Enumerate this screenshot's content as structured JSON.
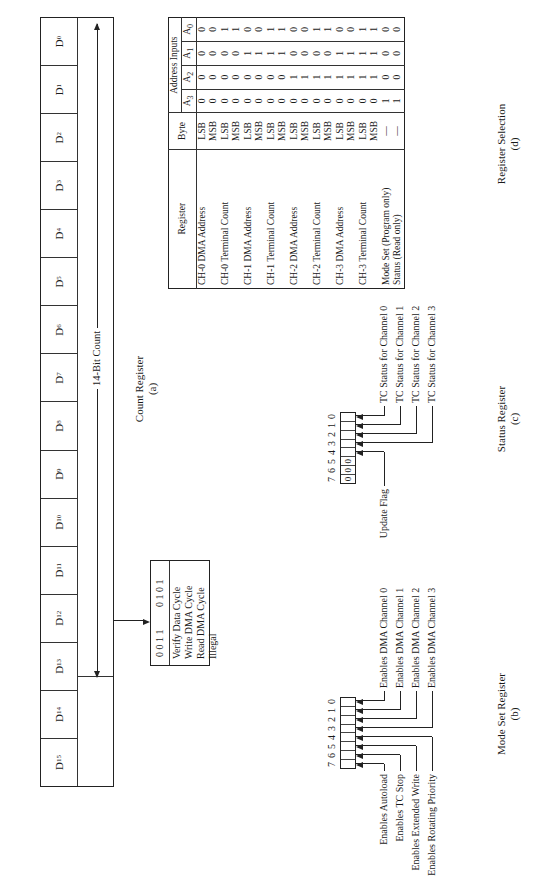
{
  "figure": {
    "count_register": {
      "bits": [
        "D15",
        "D14",
        "D13",
        "D12",
        "D11",
        "D10",
        "D9",
        "D8",
        "D7",
        "D6",
        "D5",
        "D4",
        "D3",
        "D2",
        "D1",
        "D0"
      ],
      "span_label": "14-Bit Count",
      "caption": "Count Register",
      "caption_letter": "(a)"
    },
    "cycle_types": {
      "rows": [
        {
          "label": "Verify Data Cycle",
          "b1": "0",
          "b0": "0"
        },
        {
          "label": "Write DMA Cycle",
          "b1": "0",
          "b0": "1"
        },
        {
          "label": "Read DMA Cycle",
          "b1": "1",
          "b0": "0"
        },
        {
          "label": "Illegal",
          "b1": "1",
          "b0": "1"
        }
      ]
    },
    "mode_set_register": {
      "bit_numbers": [
        "7",
        "6",
        "5",
        "4",
        "3",
        "2",
        "1",
        "0"
      ],
      "left_labels": [
        "Enables Autoload",
        "Enables TC Stop",
        "Enables Extended Write",
        "Enables Rotating Priority"
      ],
      "right_labels": [
        "Enables DMA Channel 0",
        "Enables DMA Channel 1",
        "Enables DMA Channel 2",
        "Enables DMA Channel 3"
      ],
      "caption": "Mode Set Register",
      "caption_letter": "(b)"
    },
    "status_register": {
      "bit_numbers": [
        "7",
        "6",
        "5",
        "4",
        "3",
        "2",
        "1",
        "0"
      ],
      "fixed_bits": [
        "0",
        "0",
        "0",
        "",
        "",
        "",
        "",
        ""
      ],
      "left_label": "Update Flag",
      "right_labels": [
        "TC Status for Channel 0",
        "TC Status for Channel 1",
        "TC Status for Channel 2",
        "TC Status for Channel 3"
      ],
      "caption": "Status Register",
      "caption_letter": "(c)"
    },
    "register_selection": {
      "headers": {
        "register": "Register",
        "byte": "Byte",
        "address_inputs": "Address Inputs",
        "a3": "A3",
        "a2": "A2",
        "a1": "A1",
        "a0": "A0"
      },
      "rows": [
        {
          "register": "CH-0 DMA Address",
          "byte": "LSB",
          "a3": "0",
          "a2": "0",
          "a1": "0",
          "a0": "0"
        },
        {
          "register": "",
          "byte": "MSB",
          "a3": "0",
          "a2": "0",
          "a1": "0",
          "a0": "0"
        },
        {
          "register": "CH-0 Terminal Count",
          "byte": "LSB",
          "a3": "0",
          "a2": "0",
          "a1": "0",
          "a0": "1"
        },
        {
          "register": "",
          "byte": "MSB",
          "a3": "0",
          "a2": "0",
          "a1": "0",
          "a0": "1"
        },
        {
          "register": "CH-1 DMA Address",
          "byte": "LSB",
          "a3": "0",
          "a2": "0",
          "a1": "1",
          "a0": "0"
        },
        {
          "register": "",
          "byte": "MSB",
          "a3": "0",
          "a2": "0",
          "a1": "1",
          "a0": "0"
        },
        {
          "register": "CH-1 Terminal Count",
          "byte": "LSB",
          "a3": "0",
          "a2": "0",
          "a1": "1",
          "a0": "1"
        },
        {
          "register": "",
          "byte": "MSB",
          "a3": "0",
          "a2": "0",
          "a1": "1",
          "a0": "1"
        },
        {
          "register": "CH-2 DMA Address",
          "byte": "LSB",
          "a3": "0",
          "a2": "1",
          "a1": "0",
          "a0": "0"
        },
        {
          "register": "",
          "byte": "MSB",
          "a3": "0",
          "a2": "1",
          "a1": "0",
          "a0": "0"
        },
        {
          "register": "CH-2 Terminal Count",
          "byte": "LSB",
          "a3": "0",
          "a2": "1",
          "a1": "0",
          "a0": "1"
        },
        {
          "register": "",
          "byte": "MSB",
          "a3": "0",
          "a2": "1",
          "a1": "0",
          "a0": "1"
        },
        {
          "register": "CH-3 DMA Address",
          "byte": "LSB",
          "a3": "0",
          "a2": "1",
          "a1": "1",
          "a0": "0"
        },
        {
          "register": "",
          "byte": "MSB",
          "a3": "0",
          "a2": "1",
          "a1": "1",
          "a0": "0"
        },
        {
          "register": "CH-3 Terminal Count",
          "byte": "LSB",
          "a3": "0",
          "a2": "1",
          "a1": "1",
          "a0": "1"
        },
        {
          "register": "",
          "byte": "MSB",
          "a3": "0",
          "a2": "1",
          "a1": "1",
          "a0": "1"
        },
        {
          "register": "Mode Set (Program only)",
          "byte": "—",
          "a3": "1",
          "a2": "0",
          "a1": "0",
          "a0": "0"
        },
        {
          "register": "Status (Read only)",
          "byte": "—",
          "a3": "1",
          "a2": "0",
          "a1": "0",
          "a0": "0"
        }
      ],
      "caption": "Register Selection",
      "caption_letter": "(d)"
    }
  }
}
